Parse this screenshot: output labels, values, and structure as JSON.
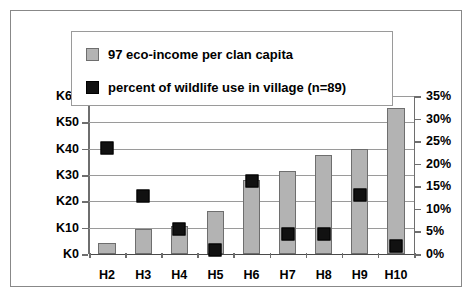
{
  "chart_data": {
    "type": "bar",
    "title": "",
    "xlabel": "",
    "ylabel": "",
    "grid": true,
    "legend_position": "top-inside",
    "categories": [
      "H2",
      "H3",
      "H4",
      "H5",
      "H6",
      "H7",
      "H8",
      "H9",
      "H10"
    ],
    "axes": {
      "left": {
        "label": "",
        "ylim": [
          0,
          60
        ],
        "ticks": [
          0,
          10,
          20,
          30,
          40,
          50,
          60
        ],
        "ticklabels": [
          "K0",
          "K10",
          "K20",
          "K30",
          "K40",
          "K50",
          "K60"
        ]
      },
      "right": {
        "label": "",
        "ylim": [
          0,
          35
        ],
        "ticks": [
          0,
          5,
          10,
          15,
          20,
          25,
          30,
          35
        ],
        "ticklabels": [
          "0%",
          "5%",
          "10%",
          "15%",
          "20%",
          "25%",
          "30%",
          "35%"
        ]
      }
    },
    "series": [
      {
        "name": "97 eco-income per clan capita",
        "render": "bar",
        "axis": "left",
        "color": "#b3b3b3",
        "values": [
          4,
          9.5,
          10.7,
          16.5,
          28,
          31.5,
          37.5,
          40,
          55.5
        ]
      },
      {
        "name": "percent of wildlife use in village (n=89)",
        "render": "marker",
        "axis": "right",
        "color": "#111111",
        "values": [
          25,
          14.2,
          6.9,
          2.3,
          17.7,
          5.8,
          5.8,
          14.4,
          3.3
        ]
      }
    ]
  },
  "legend": {
    "items": [
      {
        "label": "97 eco-income per clan capita",
        "swatch": "bar-swatch-gray"
      },
      {
        "label": "percent of wildlife use in village (n=89)",
        "swatch": "marker-swatch-black"
      }
    ]
  }
}
